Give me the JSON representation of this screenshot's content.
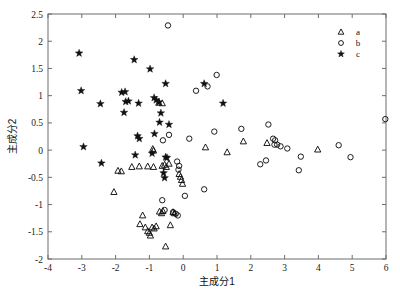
{
  "figure": {
    "background": "#ffffff",
    "frame_color": "#6d6d6d",
    "marker_color": "#111111"
  },
  "axes": {
    "x_title": "主成分1",
    "y_title": "主成分2",
    "x_ticks": [
      "-4",
      "-3",
      "-2",
      "-1",
      "0",
      "1",
      "2",
      "3",
      "4",
      "5",
      "6"
    ],
    "y_ticks": [
      "-2",
      "-1.5",
      "-1",
      "-0.5",
      "0",
      "0.5",
      "1",
      "1.5",
      "2",
      "2.5"
    ]
  },
  "legend": {
    "entries": [
      {
        "label": "a",
        "marker": "triangle"
      },
      {
        "label": "b",
        "marker": "circle"
      },
      {
        "label": "c",
        "marker": "star"
      }
    ]
  },
  "chart_data": {
    "type": "scatter",
    "title": "",
    "xlabel": "主成分1",
    "ylabel": "主成分2",
    "xlim": [
      -4,
      6
    ],
    "ylim": [
      -2,
      2.5
    ],
    "xticks": [
      -4,
      -3,
      -2,
      -1,
      0,
      1,
      2,
      3,
      4,
      5,
      6
    ],
    "yticks": [
      -2,
      -1.5,
      -1,
      -0.5,
      0,
      0.5,
      1,
      1.5,
      2,
      2.5
    ],
    "grid": false,
    "legend_position": "top-right",
    "series": [
      {
        "name": "a",
        "marker": "triangle",
        "points": [
          [
            -0.62,
            0.86
          ],
          [
            -0.72,
            0.87
          ],
          [
            -0.9,
            0.02
          ],
          [
            -0.88,
            -0.01
          ],
          [
            -1.93,
            -0.38
          ],
          [
            -1.83,
            -0.39
          ],
          [
            -1.52,
            -0.31
          ],
          [
            -1.3,
            -0.3
          ],
          [
            -1.05,
            -0.3
          ],
          [
            -0.88,
            -0.31
          ],
          [
            -0.62,
            -0.29
          ],
          [
            -0.55,
            -0.27
          ],
          [
            -0.5,
            -0.31
          ],
          [
            -0.42,
            -0.25
          ],
          [
            -0.12,
            -0.44
          ],
          [
            -0.08,
            -0.49
          ],
          [
            -0.05,
            -0.55
          ],
          [
            -0.02,
            -0.62
          ],
          [
            -2.05,
            -0.77
          ],
          [
            -1.28,
            -1.36
          ],
          [
            -1.2,
            -1.2
          ],
          [
            -1.12,
            -1.42
          ],
          [
            -1.05,
            -1.49
          ],
          [
            -1.0,
            -1.52
          ],
          [
            -0.97,
            -1.57
          ],
          [
            -0.92,
            -1.42
          ],
          [
            -0.86,
            -1.44
          ],
          [
            -0.8,
            -1.4
          ],
          [
            -0.7,
            -1.13
          ],
          [
            -0.64,
            -1.16
          ],
          [
            -0.6,
            -1.12
          ],
          [
            -0.52,
            -1.77
          ],
          [
            -0.38,
            -1.38
          ],
          [
            -0.3,
            -1.14
          ],
          [
            -0.26,
            -1.16
          ],
          [
            0.66,
            0.05
          ],
          [
            1.3,
            -0.04
          ],
          [
            1.78,
            0.16
          ],
          [
            2.48,
            0.13
          ],
          [
            3.98,
            0.01
          ]
        ]
      },
      {
        "name": "b",
        "marker": "circle",
        "points": [
          [
            -0.45,
            2.29
          ],
          [
            0.99,
            1.38
          ],
          [
            0.38,
            1.09
          ],
          [
            0.72,
            1.17
          ],
          [
            -0.42,
            0.28
          ],
          [
            -0.6,
            0.18
          ],
          [
            0.18,
            0.21
          ],
          [
            0.92,
            0.34
          ],
          [
            1.72,
            0.39
          ],
          [
            2.52,
            0.47
          ],
          [
            2.66,
            0.21
          ],
          [
            2.72,
            0.18
          ],
          [
            2.7,
            0.1
          ],
          [
            2.78,
            0.1
          ],
          [
            2.88,
            0.07
          ],
          [
            3.08,
            0.03
          ],
          [
            4.6,
            0.09
          ],
          [
            4.95,
            -0.13
          ],
          [
            3.48,
            -0.12
          ],
          [
            3.42,
            -0.37
          ],
          [
            2.28,
            -0.26
          ],
          [
            2.45,
            -0.19
          ],
          [
            5.98,
            0.57
          ],
          [
            -0.18,
            -0.21
          ],
          [
            -0.12,
            -0.29
          ],
          [
            -0.14,
            -0.36
          ],
          [
            0.62,
            -0.72
          ],
          [
            0.05,
            -0.84
          ],
          [
            -0.62,
            -0.92
          ],
          [
            -0.55,
            -1.1
          ],
          [
            -0.22,
            -1.17
          ],
          [
            -0.16,
            -1.2
          ],
          [
            -0.3,
            -1.14
          ]
        ]
      },
      {
        "name": "c",
        "marker": "star",
        "points": [
          [
            -3.08,
            1.78
          ],
          [
            -3.02,
            1.09
          ],
          [
            -1.45,
            1.66
          ],
          [
            -0.98,
            1.49
          ],
          [
            -0.52,
            1.22
          ],
          [
            0.62,
            1.22
          ],
          [
            1.18,
            0.86
          ],
          [
            -2.45,
            0.85
          ],
          [
            -1.82,
            1.06
          ],
          [
            -1.72,
            1.07
          ],
          [
            -1.7,
            0.89
          ],
          [
            -1.62,
            0.9
          ],
          [
            -1.75,
            0.69
          ],
          [
            -1.32,
            0.86
          ],
          [
            -0.86,
            0.96
          ],
          [
            -0.8,
            0.92
          ],
          [
            -0.72,
            0.88
          ],
          [
            -0.66,
            0.68
          ],
          [
            -0.7,
            0.51
          ],
          [
            -0.42,
            0.47
          ],
          [
            -1.35,
            0.26
          ],
          [
            -1.3,
            0.21
          ],
          [
            -0.85,
            0.3
          ],
          [
            -2.95,
            0.06
          ],
          [
            -1.42,
            -0.09
          ],
          [
            -0.92,
            -0.06
          ],
          [
            -2.42,
            -0.24
          ],
          [
            -0.52,
            -0.13
          ],
          [
            -0.48,
            -0.14
          ],
          [
            -0.58,
            -0.42
          ],
          [
            -0.55,
            -0.51
          ]
        ]
      }
    ]
  }
}
